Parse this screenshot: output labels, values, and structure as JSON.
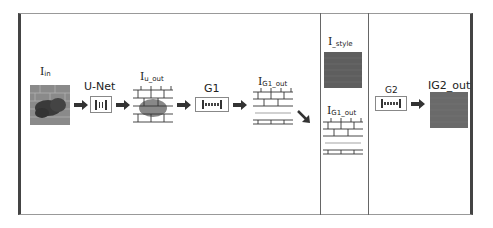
{
  "diagram": {
    "nodes": {
      "i_in": {
        "main": "I",
        "sub": "in"
      },
      "unet": {
        "label": "U-Net"
      },
      "i_u_out": {
        "main": "I",
        "sub": "u_out"
      },
      "g1": {
        "label": "G1"
      },
      "i_g1_out": {
        "main": "I",
        "sub": "G1_out"
      },
      "i_style": {
        "main": "I",
        "sub": "_style"
      },
      "i_g1_out_2": {
        "main": "I",
        "sub": "G1_out"
      },
      "g2": {
        "label": "G2"
      },
      "i_g2_out": {
        "main": "I",
        "sub": "G2_out",
        "full": "IG2_out"
      }
    },
    "edges": [
      {
        "from": "i_in",
        "to": "unet"
      },
      {
        "from": "unet",
        "to": "i_u_out"
      },
      {
        "from": "i_u_out",
        "to": "g1"
      },
      {
        "from": "g1",
        "to": "i_g1_out"
      },
      {
        "from": "i_g1_out",
        "to": "stage2",
        "style": "diagonal"
      },
      {
        "from": "g2",
        "to": "i_g2_out"
      }
    ],
    "colors": {
      "frame_dark": "#444444",
      "brick_line": "#333333",
      "stain": "#555555",
      "style_texture": "#5e5e5e",
      "output_texture": "#6a6a6a"
    }
  }
}
